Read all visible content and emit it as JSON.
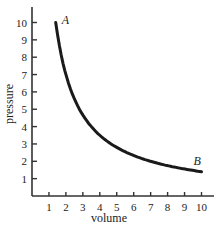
{
  "chart_data": {
    "type": "line",
    "title": "",
    "xlabel": "volume",
    "ylabel": "pressure",
    "xlim": [
      0,
      10.5
    ],
    "ylim": [
      0,
      11
    ],
    "grid": false,
    "x_ticks": [
      1,
      2,
      3,
      4,
      5,
      6,
      7,
      8,
      9,
      10
    ],
    "y_ticks": [
      1,
      2,
      3,
      4,
      5,
      6,
      7,
      8,
      9,
      10
    ],
    "series": [
      {
        "name": "pressure vs volume (P = 14/V)",
        "x": [
          1.4,
          1.6,
          1.8,
          2,
          2.5,
          3,
          3.5,
          4,
          5,
          6,
          7,
          8,
          9,
          10
        ],
        "y": [
          10,
          8.75,
          7.78,
          7,
          5.6,
          4.67,
          4,
          3.5,
          2.8,
          2.33,
          2,
          1.75,
          1.56,
          1.4
        ],
        "color": "#1a1a1a"
      }
    ],
    "annotations": [
      {
        "text": "A",
        "x": 1.4,
        "y": 10
      },
      {
        "text": "B",
        "x": 10,
        "y": 1.4
      }
    ]
  }
}
